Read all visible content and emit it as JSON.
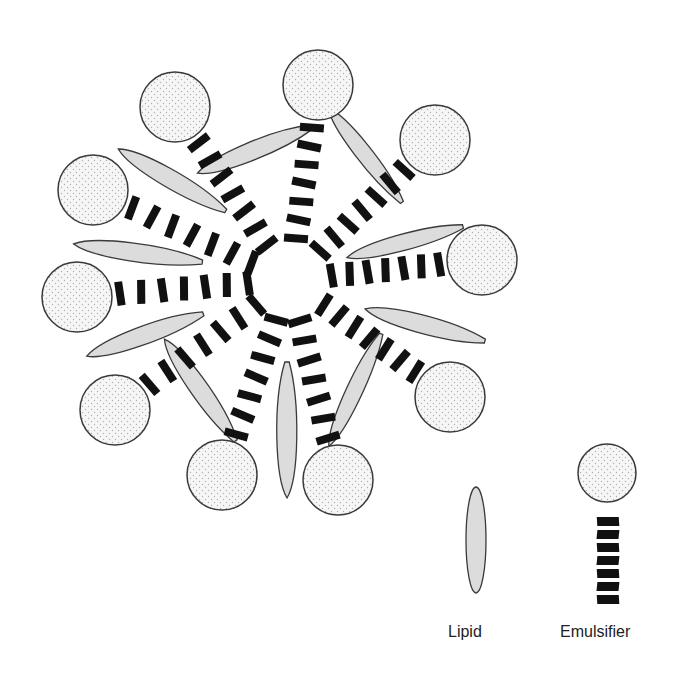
{
  "diagram": {
    "components": {
      "emulsifier": {
        "parts": [
          "hydrophilic-head",
          "hydrophobic-tail"
        ],
        "count_in_micelle": 10
      },
      "lipid": {
        "count_in_micelle": 10
      }
    },
    "colors": {
      "head_fill": "#f6f6f6",
      "head_dots": "#b5b5b5",
      "outline": "#3a3a3a",
      "lipid_fill": "#dcdcdc",
      "tail": "#111111"
    },
    "legend": {
      "lipid_label": "Lipid",
      "emulsifier_label": "Emulsifier"
    }
  }
}
